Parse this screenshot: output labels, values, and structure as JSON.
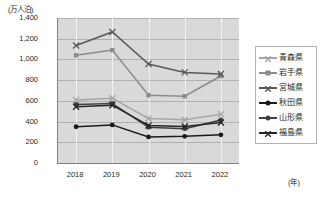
{
  "chart_data": {
    "type": "line",
    "title": "",
    "ylabel": "(万人泊)",
    "xlabel": "(年)",
    "categories": [
      "2018",
      "2019",
      "2020",
      "2021",
      "2022"
    ],
    "x": [
      2018,
      2019,
      2020,
      2021,
      2022
    ],
    "ylim": [
      0,
      1400
    ],
    "ytick_step": 200,
    "yticks": [
      "1,400",
      "1,200",
      "1,000",
      "800",
      "600",
      "400",
      "200",
      "0"
    ],
    "ytick_values": [
      1400,
      1200,
      1000,
      800,
      600,
      400,
      200,
      0
    ],
    "grid": "horizontal-and-vertical",
    "legend_position": "right",
    "series": [
      {
        "name": "青森県",
        "values": [
          608,
          625,
          430,
          418,
          470
        ],
        "color": "#a6a6a6",
        "marker": "x"
      },
      {
        "name": "岩手県",
        "values": [
          1040,
          1090,
          655,
          645,
          840
        ],
        "color": "#8c8c8c",
        "marker": "dash"
      },
      {
        "name": "宮城県",
        "values": [
          1135,
          1265,
          955,
          875,
          860
        ],
        "color": "#595959",
        "marker": "x"
      },
      {
        "name": "秋田県",
        "values": [
          350,
          368,
          252,
          258,
          272
        ],
        "color": "#1a1a1a",
        "marker": "dot"
      },
      {
        "name": "山形県",
        "values": [
          565,
          575,
          345,
          330,
          415
        ],
        "color": "#404040",
        "marker": "dot"
      },
      {
        "name": "福島県",
        "values": [
          542,
          558,
          362,
          352,
          390
        ],
        "color": "#262626",
        "marker": "x"
      }
    ]
  }
}
